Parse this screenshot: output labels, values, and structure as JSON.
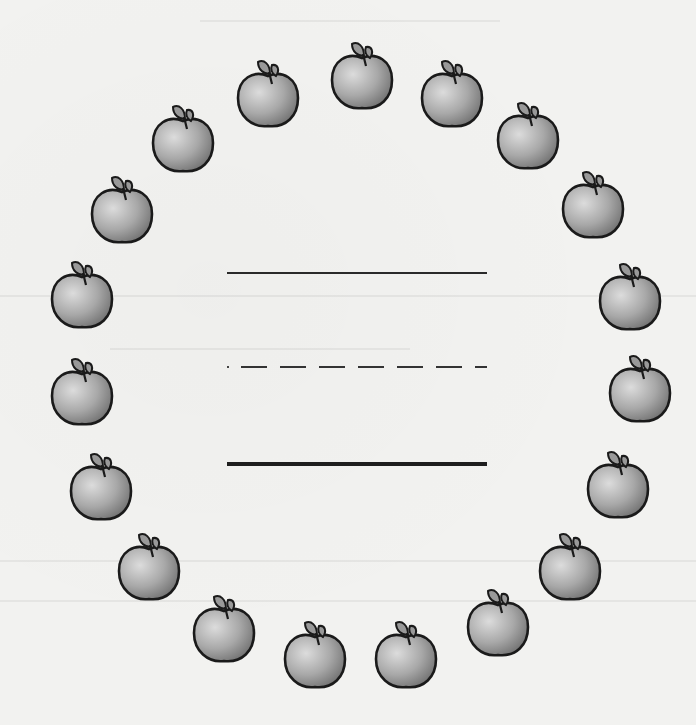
{
  "worksheet": {
    "apple_count": 19,
    "colors": {
      "paper": "#f2f2f0",
      "outline": "#1a1a1a",
      "apple_light": "#d6d6d6",
      "apple_dark": "#7a7a7a",
      "leaf": "#9a9a9a",
      "rule_line": "#2a2a2a"
    },
    "apples": [
      {
        "x": 328,
        "y": 38
      },
      {
        "x": 234,
        "y": 56
      },
      {
        "x": 418,
        "y": 56
      },
      {
        "x": 149,
        "y": 101
      },
      {
        "x": 494,
        "y": 98
      },
      {
        "x": 88,
        "y": 172
      },
      {
        "x": 559,
        "y": 167
      },
      {
        "x": 48,
        "y": 257
      },
      {
        "x": 596,
        "y": 259
      },
      {
        "x": 48,
        "y": 354
      },
      {
        "x": 606,
        "y": 351
      },
      {
        "x": 67,
        "y": 449
      },
      {
        "x": 584,
        "y": 447
      },
      {
        "x": 115,
        "y": 529
      },
      {
        "x": 536,
        "y": 529
      },
      {
        "x": 190,
        "y": 591
      },
      {
        "x": 464,
        "y": 585
      },
      {
        "x": 281,
        "y": 617
      },
      {
        "x": 372,
        "y": 617
      }
    ],
    "writing_lines": [
      {
        "type": "solid",
        "y": 272
      },
      {
        "type": "dashed",
        "y": 366
      },
      {
        "type": "solid-thick",
        "y": 462
      }
    ]
  }
}
